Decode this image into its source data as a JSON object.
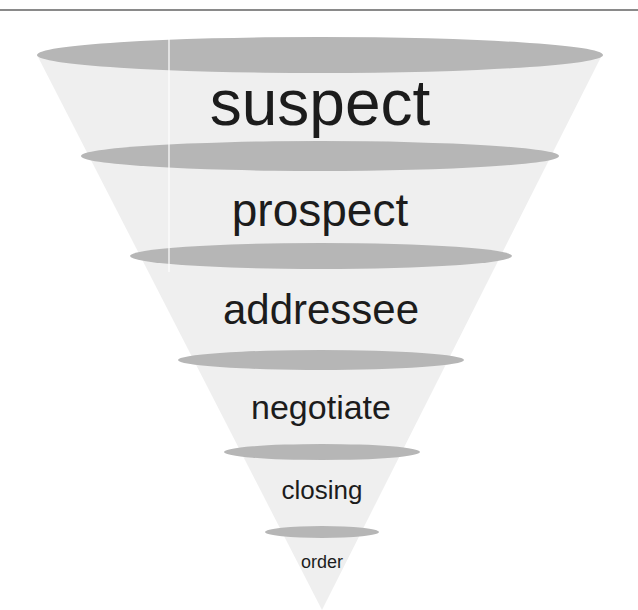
{
  "diagram": {
    "type": "sales-funnel",
    "colors": {
      "top_rule": "#8a8a8a",
      "funnel_body": "#efefef",
      "stage_rim": "#b6b6b6",
      "text": "#1c1c1c",
      "background": "#ffffff"
    },
    "stages": [
      {
        "label": "suspect"
      },
      {
        "label": "prospect"
      },
      {
        "label": "addressee"
      },
      {
        "label": "negotiate"
      },
      {
        "label": "closing"
      },
      {
        "label": "order"
      }
    ]
  }
}
